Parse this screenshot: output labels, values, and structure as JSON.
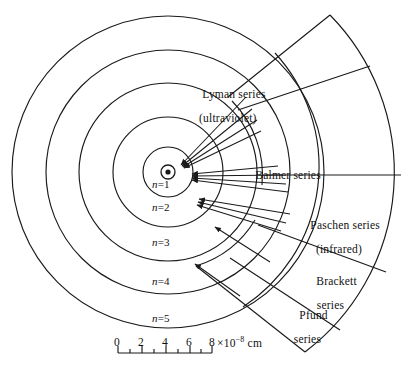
{
  "figure": {
    "stroke_color": "#1a1a1a",
    "background_color": "#ffffff"
  },
  "nucleus": {
    "name": "nucleus",
    "cx": 168,
    "cy": 172
  },
  "orbits": [
    {
      "label_n": "n",
      "label_eq": "=",
      "label_value": "1",
      "radius": 25,
      "label_x": 152,
      "label_y": 180
    },
    {
      "label_n": "n",
      "label_eq": "=",
      "label_value": "2",
      "radius": 55,
      "label_x": 152,
      "label_y": 203
    },
    {
      "label_n": "n",
      "label_eq": "=",
      "label_value": "3",
      "radius": 89,
      "label_x": 152,
      "label_y": 238
    },
    {
      "label_n": "n",
      "label_eq": "=",
      "label_value": "4",
      "radius": 122,
      "label_x": 152,
      "label_y": 277
    },
    {
      "label_n": "n",
      "label_eq": "=",
      "label_value": "5",
      "radius": 156,
      "label_x": 152,
      "label_y": 314
    }
  ],
  "series": [
    {
      "id": "lyman",
      "name": "Lyman series",
      "sub": "(ultraviolet)",
      "label_x": 190,
      "label_y": 76,
      "final_level": 1
    },
    {
      "id": "balmer",
      "name": "Balmer series",
      "sub": "",
      "label_x": 243,
      "label_y": 157,
      "final_level": 2
    },
    {
      "id": "paschen",
      "name": "Paschen series",
      "sub": "(infrared)",
      "label_x": 298,
      "label_y": 207,
      "final_level": 3
    },
    {
      "id": "brackett",
      "name": "Brackett",
      "sub": "series",
      "label_x": 304,
      "label_y": 263,
      "final_level": 4
    },
    {
      "id": "pfund",
      "name": "Pfund",
      "sub": "series",
      "label_x": 287,
      "label_y": 297,
      "final_level": 5
    }
  ],
  "scale": {
    "name": "scale-bar",
    "ticks": [
      "0",
      "2",
      "4",
      "6",
      "8"
    ],
    "tick_x": [
      118,
      142,
      166,
      190,
      212
    ],
    "unit_base": "×10",
    "unit_exp": "−8",
    "unit_suffix": " cm",
    "unit_x": 215,
    "bar_y": 353,
    "label_y": 336
  }
}
